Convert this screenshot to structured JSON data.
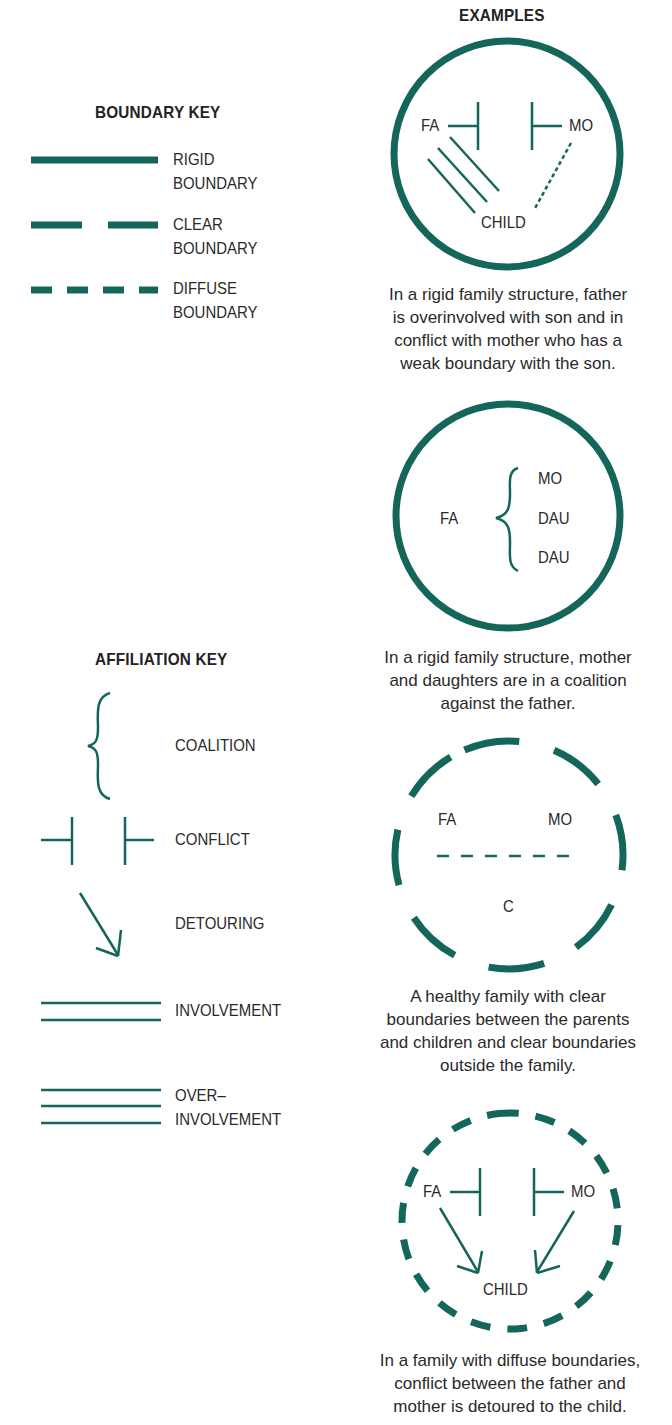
{
  "colors": {
    "teal": "#136659",
    "text": "#2a2a2a"
  },
  "boundary_key": {
    "title": "BOUNDARY KEY",
    "items": [
      {
        "style": "solid",
        "label_line1": "RIGID",
        "label_line2": "BOUNDARY"
      },
      {
        "style": "dashed",
        "label_line1": "CLEAR",
        "label_line2": "BOUNDARY"
      },
      {
        "style": "dotted-dashes",
        "label_line1": "DIFFUSE",
        "label_line2": "BOUNDARY"
      }
    ]
  },
  "affiliation_key": {
    "title": "AFFILIATION KEY",
    "items": [
      {
        "symbol": "brace",
        "label": "COALITION"
      },
      {
        "symbol": "conflict-bars",
        "label": "CONFLICT"
      },
      {
        "symbol": "arrow",
        "label": "DETOURING"
      },
      {
        "symbol": "double-line",
        "label": "INVOLVEMENT"
      },
      {
        "symbol": "triple-line",
        "label_line1": "OVER–",
        "label_line2": "INVOLVEMENT"
      }
    ]
  },
  "examples": {
    "title": "EXAMPLES",
    "items": [
      {
        "boundary": "rigid",
        "nodes": {
          "fa": "FA",
          "mo": "MO",
          "child": "CHILD"
        },
        "caption": [
          "In a rigid family structure, father",
          "is overinvolved with son and in",
          "conflict with mother who has a",
          "weak boundary with the son."
        ]
      },
      {
        "boundary": "rigid",
        "nodes": {
          "fa": "FA",
          "mo": "MO",
          "dau1": "DAU",
          "dau2": "DAU"
        },
        "caption": [
          "In a rigid family structure, mother",
          "and daughters are in a coalition",
          "against the father."
        ]
      },
      {
        "boundary": "clear",
        "nodes": {
          "fa": "FA",
          "mo": "MO",
          "c": "C"
        },
        "caption": [
          "A healthy family with clear",
          "boundaries between the parents",
          "and children and clear boundaries",
          "outside the family."
        ]
      },
      {
        "boundary": "diffuse",
        "nodes": {
          "fa": "FA",
          "mo": "MO",
          "child": "CHILD"
        },
        "caption": [
          "In a family with diffuse boundaries,",
          "conflict between the father and",
          "mother is detoured to the child."
        ]
      }
    ]
  }
}
